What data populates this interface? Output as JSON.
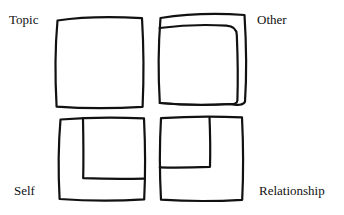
{
  "figure": {
    "type": "hand-drawn-diagram",
    "background_color": "#ffffff",
    "stroke_color": "#111111",
    "stroke_width": 2.2
  },
  "labels": {
    "top_left": "Topic",
    "top_right": "Other",
    "bottom_left": "Self",
    "bottom_right": "Relationship"
  },
  "quadrants": [
    {
      "id": "topic",
      "label": "Topic",
      "position": "top-left",
      "has_inner_rectangle": false,
      "outer_bounds": {
        "x": 55,
        "y": 17,
        "width": 88,
        "height": 91
      }
    },
    {
      "id": "other",
      "label": "Other",
      "position": "top-right",
      "has_inner_rectangle": true,
      "outer_bounds": {
        "x": 158,
        "y": 13,
        "width": 88,
        "height": 91
      },
      "inner_bounds": {
        "x": 158,
        "y": 24,
        "width": 80,
        "height": 79
      }
    },
    {
      "id": "self",
      "label": "Self",
      "position": "bottom-left",
      "has_inner_rectangle": true,
      "outer_bounds": {
        "x": 58,
        "y": 117,
        "width": 87,
        "height": 84
      },
      "inner_bounds": {
        "x": 81,
        "y": 117,
        "width": 62,
        "height": 63
      }
    },
    {
      "id": "relationship",
      "label": "Relationship",
      "position": "bottom-right",
      "has_inner_rectangle": true,
      "outer_bounds": {
        "x": 159,
        "y": 116,
        "width": 84,
        "height": 85
      },
      "inner_bounds": {
        "x": 159,
        "y": 116,
        "width": 51,
        "height": 51
      }
    }
  ]
}
